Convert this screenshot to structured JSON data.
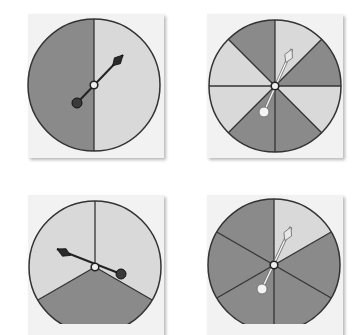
{
  "colors": {
    "dark": "#8a8a8a",
    "light": "#d9d9d9",
    "line": "#333333",
    "card": "#f2f2f2",
    "pointer_dark": "#2a2a2a",
    "pointer_light": "#e8e8e8"
  },
  "spinners": [
    {
      "id": "spinner-1",
      "sectors": 2,
      "center": [
        94,
        85
      ],
      "radius": 66,
      "card": [
        28,
        14,
        136,
        144
      ],
      "sector_colors": [
        "light",
        "dark"
      ],
      "pointer": {
        "tip": [
          123,
          55
        ],
        "tail": [
          77,
          103
        ],
        "style": "dark"
      }
    },
    {
      "id": "spinner-2",
      "sectors": 8,
      "center": [
        275,
        86
      ],
      "radius": 66,
      "card": [
        207,
        14,
        136,
        144
      ],
      "sector_colors": [
        "light",
        "dark",
        "light",
        "dark",
        "dark",
        "light",
        "light",
        "dark"
      ],
      "pointer": {
        "tip": [
          292,
          49
        ],
        "tail": [
          264,
          112
        ],
        "style": "light"
      }
    },
    {
      "id": "spinner-3",
      "sectors": 3,
      "center": [
        95,
        267
      ],
      "radius": 66,
      "card": [
        28,
        195,
        136,
        140
      ],
      "sector_colors": [
        "light",
        "dark",
        "light"
      ],
      "pointer": {
        "tip": [
          57,
          249
        ],
        "tail": [
          121,
          274
        ],
        "style": "dark"
      }
    },
    {
      "id": "spinner-4",
      "sectors": 6,
      "center": [
        274,
        265
      ],
      "radius": 66,
      "card": [
        207,
        195,
        136,
        140
      ],
      "sector_colors": [
        "light",
        "dark",
        "dark",
        "dark",
        "dark",
        "dark"
      ],
      "pointer": {
        "tip": [
          291,
          227
        ],
        "tail": [
          262,
          289
        ],
        "style": "light"
      }
    }
  ]
}
